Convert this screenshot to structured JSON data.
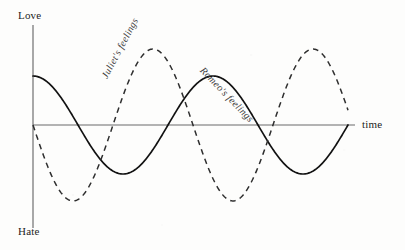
{
  "figure": {
    "background_color": "#fdfdfc",
    "axis_color": "#6a6a6a",
    "labels": {
      "y_top": "Love",
      "y_bottom": "Hate",
      "x_axis": "time"
    },
    "curve_labels": {
      "juliet": "Juliet's feelings",
      "romeo": "Romeo's feelings"
    }
  },
  "chart_data": {
    "type": "line",
    "title": "",
    "subtitle": "",
    "xlabel": "time",
    "ylabel": "",
    "ytick_labels": [
      "Love",
      "Hate"
    ],
    "xtick_labels": [],
    "grid": false,
    "legend": "inline-annotations",
    "axis_origin": {
      "x": 33,
      "y": 125
    },
    "xlim": [
      0,
      6.3
    ],
    "ylim": [
      -1.6,
      1.6
    ],
    "annotations": [
      {
        "text": "Juliet's feelings",
        "series": "juliet",
        "rotation_deg": -62,
        "x_px": 104,
        "y_px": 72
      },
      {
        "text": "Romeo's feelings",
        "series": "romeo",
        "rotation_deg": 46,
        "x_px": 202,
        "y_px": 63
      }
    ],
    "series": [
      {
        "name": "Romeo's feelings",
        "style": "solid",
        "color": "#121212",
        "description": "cosine, amplitude 1.0, period 180 px, starts near peak at Love side",
        "amplitude": 1.0,
        "period_px": 180,
        "phase": "cosine (max at x=0)",
        "key_points_px": [
          {
            "x": 33,
            "y": 76,
            "role": "start-peak"
          },
          {
            "x": 75,
            "y": 125,
            "role": "zero-crossing-down"
          },
          {
            "x": 115,
            "y": 175,
            "role": "trough"
          },
          {
            "x": 160,
            "y": 125,
            "role": "zero-crossing-up"
          },
          {
            "x": 205,
            "y": 76,
            "role": "peak"
          },
          {
            "x": 250,
            "y": 125,
            "role": "zero-crossing-down"
          },
          {
            "x": 295,
            "y": 176,
            "role": "trough"
          },
          {
            "x": 338,
            "y": 125,
            "role": "zero-crossing-up"
          },
          {
            "x": 348,
            "y": 95,
            "role": "end"
          }
        ]
      },
      {
        "name": "Juliet's feelings",
        "style": "dashed",
        "color": "#2e2e2e",
        "description": "negative sine, amplitude 1.55, period 160 px, starts at zero descending toward Hate",
        "amplitude": 1.55,
        "period_px": 160,
        "phase": "negative sine (zero at x=0, descending)",
        "key_points_px": [
          {
            "x": 33,
            "y": 125,
            "role": "start-zero-down"
          },
          {
            "x": 77,
            "y": 202,
            "role": "trough"
          },
          {
            "x": 124,
            "y": 125,
            "role": "zero-crossing-up"
          },
          {
            "x": 167,
            "y": 48,
            "role": "peak"
          },
          {
            "x": 206,
            "y": 125,
            "role": "zero-crossing-down"
          },
          {
            "x": 245,
            "y": 203,
            "role": "trough"
          },
          {
            "x": 287,
            "y": 125,
            "role": "zero-crossing-up"
          },
          {
            "x": 327,
            "y": 50,
            "role": "peak"
          },
          {
            "x": 348,
            "y": 62,
            "role": "end"
          }
        ]
      }
    ]
  }
}
